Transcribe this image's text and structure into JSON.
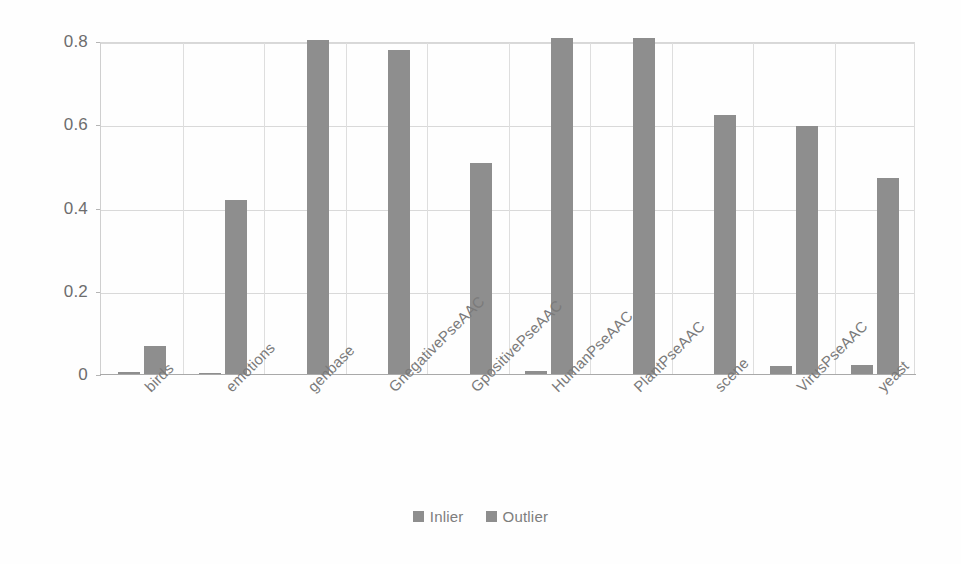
{
  "chart_data": {
    "type": "bar",
    "title": "",
    "subtitle": "",
    "xlabel": "",
    "ylabel": "",
    "ylim": [
      0,
      0.8
    ],
    "yticks": [
      "0",
      "0.2",
      "0.4",
      "0.6",
      "0.8"
    ],
    "ytick_values": [
      0,
      0.2,
      0.4,
      0.6,
      0.8
    ],
    "grid": true,
    "legend_position": "bottom",
    "bar_color": "#8e8e8e",
    "categories": [
      "birds",
      "emotions",
      "genbase",
      "GnegativePseAAC",
      "GpositivePseAAC",
      "HumanPseAAC",
      "PlantPseAAC",
      "scene",
      "VirusPseAAC",
      "yeast"
    ],
    "series": [
      {
        "name": "Inlier",
        "color": "#8e8e8e",
        "values": [
          0.008,
          0.004,
          0.0,
          0.0,
          0.0,
          0.01,
          0.0,
          0.0,
          0.022,
          0.025
        ]
      },
      {
        "name": "Outlier",
        "color": "#8e8e8e",
        "values": [
          0.07,
          0.42,
          0.805,
          0.78,
          0.51,
          0.81,
          0.81,
          0.625,
          0.598,
          0.473
        ]
      }
    ]
  },
  "legend": {
    "items": [
      {
        "label": "Inlier",
        "swatch": "legend-swatch-inlier"
      },
      {
        "label": "Outlier",
        "swatch": "legend-swatch-outlier"
      }
    ]
  }
}
